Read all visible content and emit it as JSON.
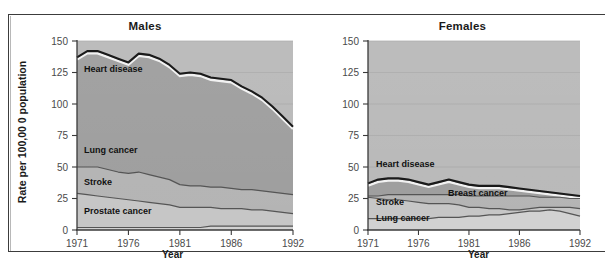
{
  "figure": {
    "background": "#ffffff",
    "frame_color": "#3c3c3c"
  },
  "chart_data": [
    {
      "type": "area",
      "title": "Males",
      "xlabel": "Year",
      "ylabel": "Rate per 100,00 0 population",
      "stacked": true,
      "grid": true,
      "legend_position": "inline-labels",
      "xlim": [
        1971,
        1992
      ],
      "ylim": [
        0,
        150
      ],
      "yticks": [
        0,
        25,
        50,
        75,
        100,
        125,
        150
      ],
      "xticks": [
        1971,
        1976,
        1981,
        1986,
        1992
      ],
      "x": [
        1971,
        1972,
        1973,
        1974,
        1975,
        1976,
        1977,
        1978,
        1979,
        1980,
        1981,
        1982,
        1983,
        1984,
        1985,
        1986,
        1987,
        1988,
        1989,
        1990,
        1991,
        1992
      ],
      "series": [
        {
          "name": "Heart disease",
          "label": "Heart disease",
          "color": "#9e9e9e",
          "line_color": "#1a1a1a",
          "cumulative_top": [
            137,
            142,
            142,
            139,
            136,
            133,
            140,
            139,
            136,
            131,
            124,
            125,
            124,
            121,
            120,
            119,
            114,
            110,
            105,
            98,
            90,
            82
          ]
        },
        {
          "name": "Lung cancer",
          "label": "Lung cancer",
          "color": "#b4b4b4",
          "line_color": "#555555",
          "cumulative_top": [
            50,
            50,
            50,
            48,
            46,
            45,
            46,
            44,
            42,
            40,
            36,
            35,
            35,
            34,
            34,
            33,
            32,
            32,
            31,
            30,
            29,
            28
          ]
        },
        {
          "name": "Stroke",
          "label": "Stroke",
          "color": "#c6c6c6",
          "line_color": "#555555",
          "cumulative_top": [
            29,
            28,
            27,
            26,
            25,
            24,
            23,
            22,
            21,
            20,
            18,
            18,
            18,
            18,
            17,
            17,
            17,
            16,
            16,
            15,
            14,
            13
          ]
        },
        {
          "name": "Prostate cancer",
          "label": "Prostate cancer",
          "color": "#d2d2d2",
          "line_color": "#555555",
          "cumulative_top": [
            2,
            2,
            2,
            2,
            2,
            2,
            2,
            2,
            2,
            2,
            2,
            2,
            2,
            3,
            3,
            3,
            3,
            3,
            3,
            3,
            3,
            3
          ]
        }
      ]
    },
    {
      "type": "area",
      "title": "Females",
      "xlabel": "Year",
      "ylabel": "",
      "stacked": true,
      "grid": true,
      "legend_position": "inline-labels",
      "xlim": [
        1971,
        1992
      ],
      "ylim": [
        0,
        150
      ],
      "yticks": [
        0,
        25,
        50,
        75,
        100,
        125,
        150
      ],
      "xticks": [
        1971,
        1976,
        1981,
        1986,
        1992
      ],
      "x": [
        1971,
        1972,
        1973,
        1974,
        1975,
        1976,
        1977,
        1978,
        1979,
        1980,
        1981,
        1982,
        1983,
        1984,
        1985,
        1986,
        1987,
        1988,
        1989,
        1990,
        1991,
        1992
      ],
      "series": [
        {
          "name": "Heart disease",
          "label": "Heart disease",
          "color": "#9e9e9e",
          "line_color": "#1a1a1a",
          "cumulative_top": [
            37,
            40,
            41,
            41,
            40,
            38,
            36,
            38,
            40,
            38,
            36,
            35,
            35,
            35,
            34,
            33,
            32,
            31,
            30,
            29,
            28,
            27
          ]
        },
        {
          "name": "Breast cancer",
          "label": "Breast cancer",
          "color": "#b4b4b4",
          "line_color": "#555555",
          "cumulative_top": [
            27,
            27,
            28,
            28,
            28,
            28,
            28,
            28,
            28,
            28,
            27,
            27,
            27,
            27,
            27,
            27,
            27,
            26,
            26,
            26,
            25,
            25
          ]
        },
        {
          "name": "Stroke",
          "label": "Stroke",
          "color": "#c6c6c6",
          "line_color": "#555555",
          "cumulative_top": [
            26,
            25,
            24,
            24,
            23,
            22,
            21,
            21,
            21,
            20,
            18,
            18,
            17,
            17,
            16,
            16,
            17,
            18,
            18,
            18,
            18,
            17
          ]
        },
        {
          "name": "Lung cancer",
          "label": "Lung cancer",
          "color": "#d2d2d2",
          "line_color": "#555555",
          "cumulative_top": [
            9,
            9,
            9,
            9,
            9,
            9,
            9,
            10,
            10,
            10,
            11,
            11,
            12,
            12,
            13,
            14,
            15,
            15,
            16,
            15,
            13,
            11
          ]
        }
      ]
    }
  ]
}
